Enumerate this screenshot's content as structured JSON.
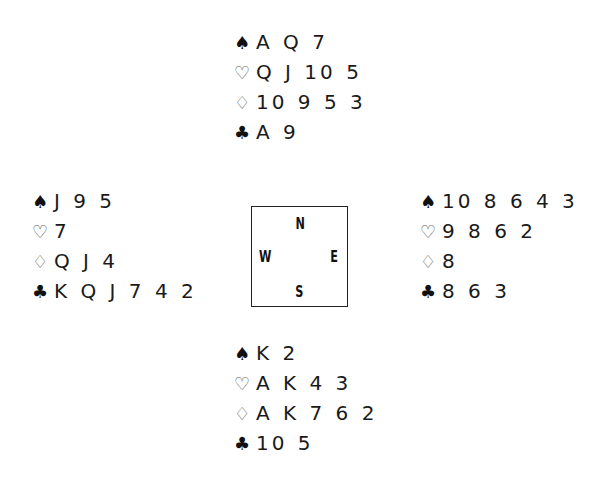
{
  "suit_symbols": {
    "spades": "♠",
    "hearts": "♡",
    "diamonds": "♢",
    "clubs": "♣"
  },
  "compass": {
    "north": "N",
    "west": "W",
    "east": "E",
    "south": "S"
  },
  "hands": {
    "north": {
      "spades": "A Q 7",
      "hearts": "Q J 10 5",
      "diamonds": "10 9 5 3",
      "clubs": "A 9"
    },
    "west": {
      "spades": "J 9 5",
      "hearts": "7",
      "diamonds": "Q J 4",
      "clubs": "K Q J 7 4 2"
    },
    "east": {
      "spades": "10 8 6 4 3",
      "hearts": "9 8 6 2",
      "diamonds": "8",
      "clubs": "8 6 3"
    },
    "south": {
      "spades": "K 2",
      "hearts": "A K 4 3",
      "diamonds": "A K 7 6 2",
      "clubs": "10 5"
    }
  }
}
